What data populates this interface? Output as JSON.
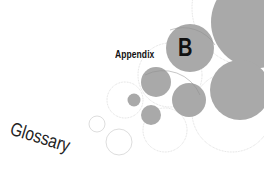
{
  "page": {
    "appendix_label": "Appendix",
    "appendix_letter": "B",
    "title": "Glossary"
  },
  "colors": {
    "circle_fill": "#a9a9a9",
    "circle_outline": "#c8c8c8",
    "text": "#111111",
    "background": "#ffffff"
  }
}
